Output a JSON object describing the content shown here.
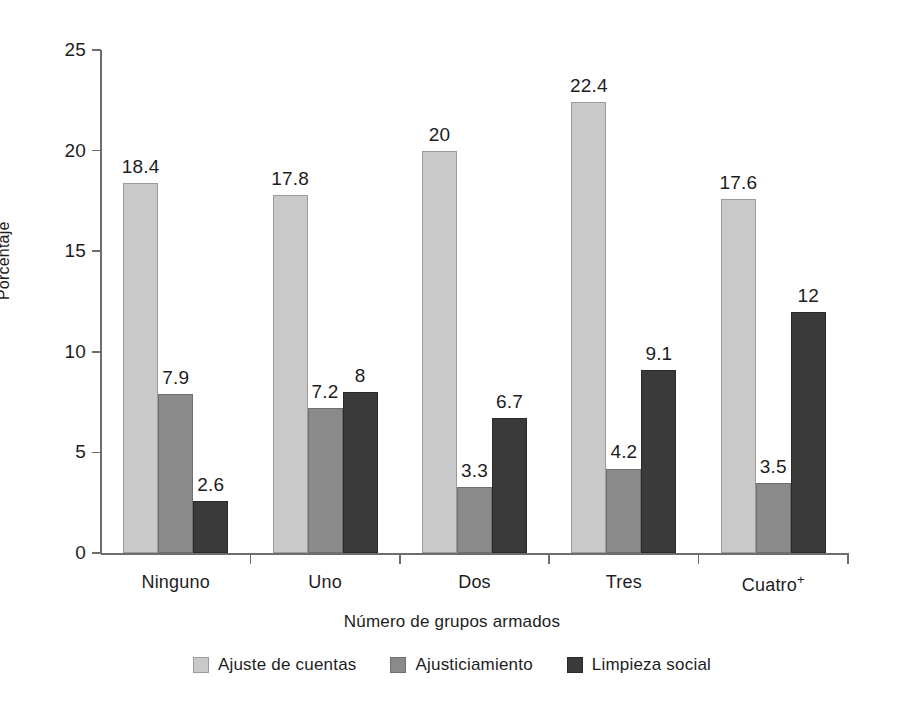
{
  "chart_data": {
    "type": "bar",
    "title": "",
    "xlabel": "Número de grupos armados",
    "ylabel": "Porcentaje",
    "categories": [
      "Ninguno",
      "Uno",
      "Dos",
      "Tres",
      "Cuatro+"
    ],
    "category_labels_html": [
      "Ninguno",
      "Uno",
      "Dos",
      "Tres",
      "Cuatro⁺"
    ],
    "series": [
      {
        "name": "Ajuste de cuentas",
        "color": "#c9c9c9",
        "values": [
          18.4,
          17.8,
          20,
          22.4,
          17.6
        ],
        "labels": [
          "18.4",
          "17.8",
          "20",
          "22.4",
          "17.6"
        ]
      },
      {
        "name": "Ajusticiamiento",
        "color": "#8a8a8a",
        "values": [
          7.9,
          7.2,
          3.3,
          4.2,
          3.5
        ],
        "labels": [
          "7.9",
          "7.2",
          "3.3",
          "4.2",
          "3.5"
        ]
      },
      {
        "name": "Limpieza social",
        "color": "#3a3a3a",
        "values": [
          2.6,
          8,
          6.7,
          9.1,
          12
        ],
        "labels": [
          "2.6",
          "8",
          "6.7",
          "9.1",
          "12"
        ]
      }
    ],
    "ylim": [
      0,
      25
    ],
    "yticks": [
      0,
      5,
      10,
      15,
      20,
      25
    ],
    "ytick_labels": [
      "0",
      "5",
      "10",
      "15",
      "20",
      "25"
    ],
    "grid": false,
    "legend_position": "bottom"
  }
}
